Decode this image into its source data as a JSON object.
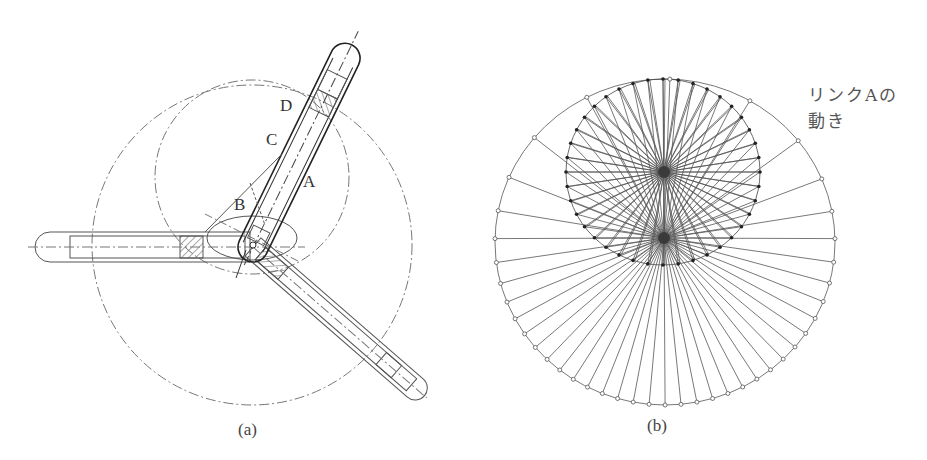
{
  "figure_a": {
    "caption": "(a)",
    "labels": {
      "A": "A",
      "B": "B",
      "C": "C",
      "D": "D"
    },
    "big_circle": {
      "cx": 252,
      "cy": 245,
      "r": 160
    },
    "small_circle": {
      "cx": 252,
      "cy": 177,
      "r": 97
    },
    "pivot": {
      "x": 253,
      "y": 245
    }
  },
  "figure_b": {
    "caption": "(b)",
    "annotation_line1": "リンクAの",
    "annotation_line2": "動き",
    "outer_circle": {
      "cx": 665,
      "cy": 242,
      "rx": 170,
      "ry": 163
    },
    "inner_ellipse": {
      "cx": 663,
      "cy": 172,
      "rx": 97,
      "ry": 93
    },
    "focus_upper": {
      "x": 664,
      "y": 172
    },
    "focus_lower": {
      "x": 664,
      "y": 238
    },
    "spoke_count": 40
  },
  "colors": {
    "line": "#555555",
    "dash": "#777777",
    "text": "#333333"
  }
}
